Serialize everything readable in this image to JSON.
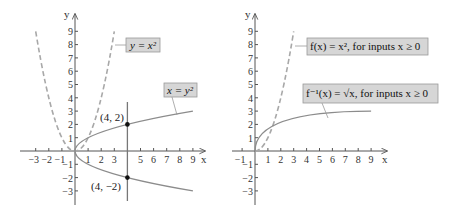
{
  "colors": {
    "axis": "#555555",
    "curve": "#8c8c8c",
    "dashed": "#a8a8a8",
    "label_bg": "#d6d6d6",
    "label_border": "#9a9a9a",
    "point": "#111111"
  },
  "left_panel": {
    "x_axis_label": "x",
    "y_axis_label": "y",
    "x_ticks": [
      "−3",
      "−2",
      "−1",
      "1",
      "2",
      "3",
      "5",
      "6",
      "7",
      "8",
      "9"
    ],
    "y_ticks": [
      "9",
      "8",
      "7",
      "6",
      "5",
      "4",
      "3",
      "2",
      "1",
      "−1",
      "−2",
      "−3"
    ],
    "label_parabola": "y = x²",
    "label_sideways": "x = y²",
    "point_upper": "(4, 2)",
    "point_lower": "(4, −2)"
  },
  "right_panel": {
    "x_axis_label": "x",
    "y_axis_label": "y",
    "x_ticks": [
      "−1",
      "1",
      "2",
      "3",
      "4",
      "5",
      "6",
      "7",
      "8",
      "9"
    ],
    "y_ticks": [
      "9",
      "8",
      "7",
      "6",
      "5",
      "4",
      "3",
      "2",
      "1",
      "−1",
      "−2",
      "−3"
    ],
    "label_f": "f(x) = x², for inputs x ≥ 0",
    "label_finv": "f⁻¹(x) = √x, for inputs x ≥ 0"
  }
}
